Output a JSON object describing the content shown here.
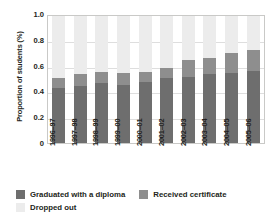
{
  "chart_data": {
    "type": "bar",
    "stacked": true,
    "title": "",
    "xlabel": "",
    "ylabel": "Proportion of students (%)",
    "ylim": [
      0,
      1.0
    ],
    "yticks": [
      "1.0",
      "0.8",
      "0.6",
      "0.4",
      "0.2",
      "0"
    ],
    "ytick_values": [
      1.0,
      0.8,
      0.6,
      0.4,
      0.2,
      0
    ],
    "grid": true,
    "legend_position": "bottom-left",
    "categories": [
      "1996–97",
      "1997–98",
      "1998–99",
      "1999–00",
      "2000–01",
      "2001–02",
      "2002–03",
      "2003–04",
      "2004–05",
      "2005–06"
    ],
    "series": [
      {
        "name": "Graduated with a diploma",
        "color": "#6e6e6e",
        "values": [
          0.43,
          0.45,
          0.47,
          0.46,
          0.48,
          0.51,
          0.52,
          0.54,
          0.55,
          0.57
        ]
      },
      {
        "name": "Received certificate",
        "color": "#8e8e8e",
        "values": [
          0.08,
          0.09,
          0.09,
          0.09,
          0.08,
          0.08,
          0.13,
          0.13,
          0.16,
          0.16
        ]
      },
      {
        "name": "Dropped out",
        "color": "#ececec",
        "values": [
          0.49,
          0.46,
          0.44,
          0.45,
          0.44,
          0.41,
          0.35,
          0.33,
          0.29,
          0.27
        ]
      }
    ],
    "stack_totals": [
      0.51,
      0.54,
      0.56,
      0.55,
      0.56,
      0.59,
      0.65,
      0.67,
      0.71,
      0.73
    ]
  },
  "legend": {
    "items": [
      {
        "label": "Graduated with a diploma",
        "color": "#6e6e6e"
      },
      {
        "label": "Received  certificate",
        "color": "#8e8e8e"
      },
      {
        "label": "Dropped out",
        "color": "#ececec"
      }
    ]
  }
}
